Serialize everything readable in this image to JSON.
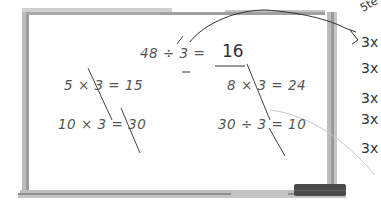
{
  "whiteboard": {
    "main_equation": {
      "left": "48 ÷ ",
      "divisor": "3",
      "equals": " = ",
      "answer": "16"
    },
    "equations": [
      {
        "text": "5 × 3 = 15"
      },
      {
        "text": "8 × 3 = 24"
      },
      {
        "text": "10 × 3 = 30"
      },
      {
        "text": "30 ÷ 3 = 10"
      }
    ]
  },
  "margin_notes": {
    "top": "5te",
    "lines": [
      "3x",
      "3x",
      "3x",
      "3x",
      "3x"
    ]
  },
  "colors": {
    "frame": "#b8b8b8",
    "frame_dark": "#8a8a8a",
    "marker_ink": "#555555",
    "pencil": "#333333",
    "eraser": "#4a4a4a",
    "marker_tray": "#c4c4c4"
  }
}
